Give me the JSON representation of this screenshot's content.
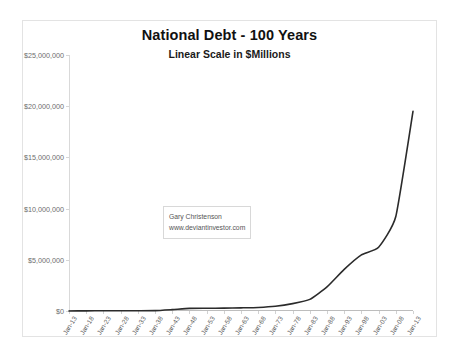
{
  "chart_data": {
    "type": "line",
    "title": "National Debt - 100 Years",
    "subtitle": "Linear Scale in $Millions",
    "xlabel": "",
    "ylabel": "",
    "ylim": [
      0,
      25000000
    ],
    "yticks": [
      0,
      5000000,
      10000000,
      15000000,
      20000000,
      25000000
    ],
    "ytick_labels": [
      "$0",
      "$5,000,000",
      "$10,000,000",
      "$15,000,000",
      "$20,000,000",
      "$25,000,000"
    ],
    "grid": false,
    "legend": "none",
    "line_color": "#2b2b2b",
    "categories": [
      "Jan-13",
      "Jan-18",
      "Jan-23",
      "Jan-28",
      "Jan-33",
      "Jan-38",
      "Jan-43",
      "Jan-48",
      "Jan-53",
      "Jan-58",
      "Jan-63",
      "Jan-68",
      "Jan-73",
      "Jan-78",
      "Jan-83",
      "Jan-88",
      "Jan-93",
      "Jan-98",
      "Jan-03",
      "Jan-08",
      "Jan-13"
    ],
    "series": [
      {
        "name": "National Debt",
        "values": [
          2900,
          12455,
          22350,
          18510,
          22539,
          37165,
          136696,
          252292,
          266071,
          276343,
          305860,
          344663,
          458141,
          718943,
          1137345,
          2350277,
          4064621,
          5478189,
          6228236,
          9229172,
          19500000
        ]
      }
    ],
    "annotations": [
      {
        "name": "credit",
        "line1": "Gary Christenson",
        "line2": "www.deviantinvestor.com"
      }
    ]
  }
}
